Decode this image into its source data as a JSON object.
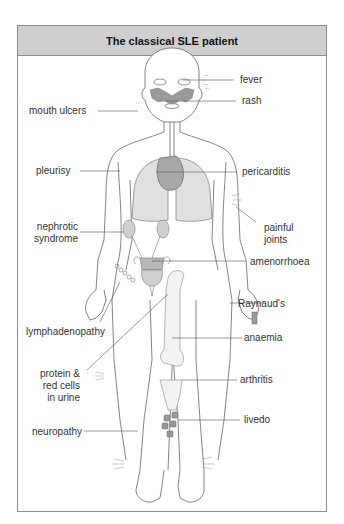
{
  "figure": {
    "title": "The classical SLE patient",
    "colors": {
      "header_bg": "#cfcfcf",
      "border": "#8c8c8c",
      "organ_fill": "#d9d9d9",
      "organ_dark": "#a9a9a9",
      "outline": "#666666"
    },
    "labels_left": [
      {
        "id": "mouth_ulcers",
        "text": "mouth ulcers"
      },
      {
        "id": "pleurisy",
        "text": "pleurisy"
      },
      {
        "id": "nephrotic_syndrome",
        "line1": "nephrotic",
        "line2": "syndrome"
      },
      {
        "id": "lymphadenopathy",
        "text": "lymphadenopathy"
      },
      {
        "id": "protein_red_cells",
        "line1": "protein &",
        "line2": "red cells",
        "line3": "in urine"
      },
      {
        "id": "neuropathy",
        "text": "neuropathy"
      }
    ],
    "labels_right": [
      {
        "id": "fever",
        "text": "fever"
      },
      {
        "id": "rash",
        "text": "rash"
      },
      {
        "id": "pericarditis",
        "text": "pericarditis"
      },
      {
        "id": "painful_joints",
        "line1": "painful",
        "line2": "joints"
      },
      {
        "id": "amenorrhoea",
        "text": "amenorrhoea"
      },
      {
        "id": "raynauds",
        "text": "Raynaud's"
      },
      {
        "id": "anaemia",
        "text": "anaemia"
      },
      {
        "id": "arthritis",
        "text": "arthritis"
      },
      {
        "id": "livedo",
        "text": "livedo"
      }
    ]
  }
}
